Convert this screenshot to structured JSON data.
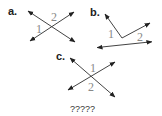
{
  "figures": [
    {
      "label": "a.",
      "angle_labels": [
        "1",
        "2"
      ]
    },
    {
      "label": "b.",
      "angle_labels": [
        "1",
        "2"
      ]
    },
    {
      "label": "c.",
      "angle_labels": [
        "1",
        "2"
      ]
    }
  ],
  "caption": "?????"
}
